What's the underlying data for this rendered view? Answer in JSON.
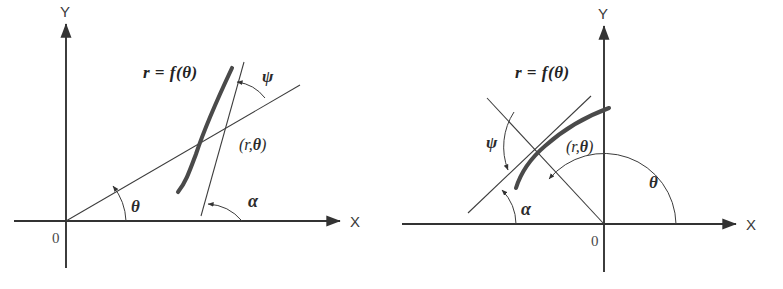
{
  "figure": {
    "name": "polar-curve-angle-diagram",
    "background_color": "#ffffff",
    "ink_color": "#333333",
    "curve_color": "#3a3a3a",
    "width": 783,
    "height": 289,
    "panel_count": 2
  },
  "panels": [
    {
      "id": "left",
      "axis_x_label": "X",
      "axis_y_label": "Y",
      "origin_label": "0",
      "curve_equation_label": "r = f(θ)",
      "point_label_open": "(",
      "point_label_r": "r",
      "point_label_comma": ",",
      "point_label_theta": "θ",
      "point_label_close": ")",
      "angle_theta_label": "θ",
      "angle_alpha_label": "α",
      "angle_psi_label": "ψ",
      "description": "Polar curve r = f(theta) in the first quadrant; radius vector from origin makes angle theta with the X axis, the tangent line makes angle alpha with the X axis, and psi is the angle between the radius vector and the tangent."
    },
    {
      "id": "right",
      "axis_x_label": "X",
      "axis_y_label": "Y",
      "origin_label": "0",
      "curve_equation_label": "r = f(θ)",
      "point_label_open": "(",
      "point_label_r": "r",
      "point_label_comma": ",",
      "point_label_theta": "θ",
      "point_label_close": ")",
      "angle_theta_label": "θ",
      "angle_alpha_label": "α",
      "angle_psi_label": "ψ",
      "description": "Polar curve r = f(theta) in the second quadrant; the radius vector from origin makes an obtuse angle theta with the positive X axis, the tangent makes acute angle alpha with the X axis, and psi is the angle between radius vector and tangent."
    }
  ]
}
